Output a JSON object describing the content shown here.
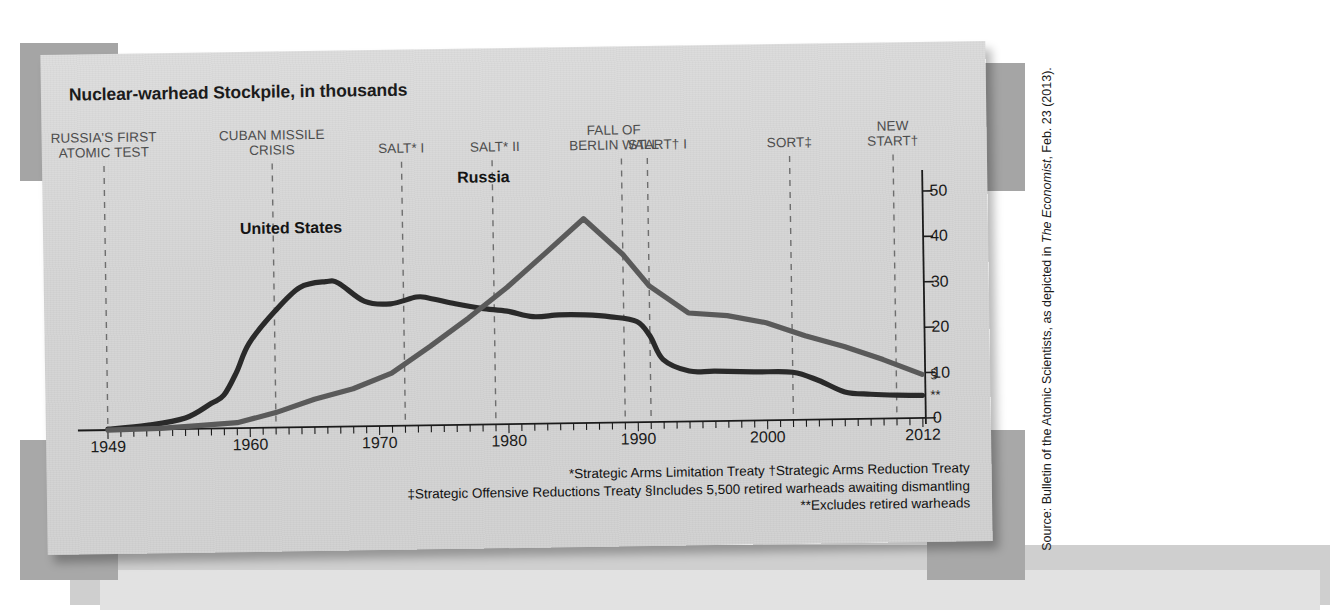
{
  "chart_title": "Nuclear-warhead Stockpile, in thousands",
  "source_credit": {
    "prefix": "Source: Bulletin of the Atomic Scientists, as depicted in ",
    "italic": "The Economist",
    "suffix": ", Feb. 23 (2013)."
  },
  "series_labels": {
    "united_states": "United States",
    "russia": "Russia"
  },
  "end_markers": {
    "russia": "§",
    "united_states": "**"
  },
  "footnotes": [
    "*Strategic Arms Limitation Treaty   †Strategic Arms Reduction Treaty",
    "‡Strategic Offensive Reductions Treaty   §Includes 5,500 retired warheads awaiting dismantling",
    "**Excludes retired warheads"
  ],
  "colors": {
    "united_states_line": "#2a2a2a",
    "russia_line": "#5a5a5a",
    "axis": "#1b1b1b",
    "event_text": "#4d4d4d",
    "paper": "#d6d6d6"
  },
  "chart_data": {
    "type": "line",
    "title": "Nuclear-warhead Stockpile, in thousands",
    "xlabel": "",
    "ylabel": "Nuclear warheads (thousands)",
    "xlim": [
      1949,
      2012
    ],
    "ylim": [
      0,
      52
    ],
    "grid": false,
    "legend": "inline-labels",
    "xticks": [
      "1949",
      "1960",
      "1970",
      "1980",
      "1990",
      "2000",
      "2012"
    ],
    "xtick_values": [
      1949,
      1960,
      1970,
      1980,
      1990,
      2000,
      2012
    ],
    "yticks": [
      "0",
      "10",
      "20",
      "30",
      "40",
      "50"
    ],
    "ytick_values": [
      0,
      10,
      20,
      30,
      40,
      50
    ],
    "series": [
      {
        "name": "United States",
        "color": "#2a2a2a",
        "x": [
          1949,
          1952,
          1955,
          1957,
          1958,
          1959,
          1960,
          1962,
          1964,
          1966,
          1967,
          1969,
          1971,
          1973,
          1974,
          1976,
          1978,
          1980,
          1982,
          1984,
          1986,
          1988,
          1990,
          1991,
          1992,
          1994,
          1996,
          1999,
          2002,
          2004,
          2006,
          2008,
          2010,
          2012
        ],
        "y": [
          0.2,
          0.9,
          2.4,
          5.5,
          7.3,
          12.3,
          18.6,
          25.5,
          30.8,
          32.0,
          31.6,
          27.5,
          26.9,
          28.3,
          28.0,
          26.7,
          25.6,
          24.9,
          23.6,
          23.9,
          23.8,
          23.3,
          22.2,
          19.0,
          13.7,
          11.1,
          11.0,
          10.7,
          10.5,
          8.6,
          6.0,
          5.4,
          5.1,
          5.0
        ],
        "end_label": "**"
      },
      {
        "name": "Russia",
        "color": "#5a5a5a",
        "x": [
          1949,
          1953,
          1956,
          1959,
          1962,
          1965,
          1968,
          1971,
          1974,
          1977,
          1980,
          1983,
          1986,
          1989,
          1991,
          1994,
          1997,
          2000,
          2003,
          2006,
          2009,
          2012
        ],
        "y": [
          0.0,
          0.2,
          0.7,
          1.2,
          3.3,
          6.1,
          8.3,
          11.6,
          17.4,
          23.5,
          30.1,
          37.5,
          45.0,
          37.0,
          30.0,
          23.9,
          23.2,
          21.5,
          18.5,
          16.0,
          13.0,
          9.6
        ],
        "end_label": "§"
      }
    ],
    "annotations": [
      {
        "label": "RUSSIA'S FIRST\nATOMIC TEST",
        "year": 1949
      },
      {
        "label": "CUBAN MISSILE\nCRISIS",
        "year": 1962
      },
      {
        "label": "SALT* I",
        "year": 1972
      },
      {
        "label": "SALT* II",
        "year": 1979
      },
      {
        "label": "FALL OF\nBERLIN WALL",
        "year": 1989
      },
      {
        "label": "START† I",
        "year": 1991
      },
      {
        "label": "SORT‡",
        "year": 2002
      },
      {
        "label": "NEW\nSTART†",
        "year": 2010
      }
    ]
  }
}
